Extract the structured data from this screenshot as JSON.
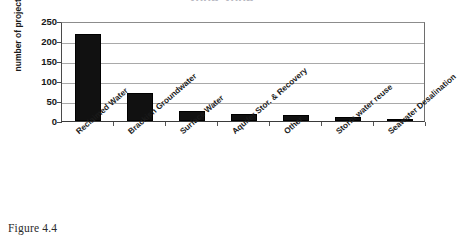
{
  "figure": {
    "caption": "Figure 4.4",
    "title_partial": "2005 2006"
  },
  "chart_data": {
    "type": "bar",
    "title": "",
    "xlabel": "",
    "ylabel": "number of projects",
    "ylim": [
      0,
      250
    ],
    "yticks": [
      0,
      50,
      100,
      150,
      200,
      250
    ],
    "grid": true,
    "legend": false,
    "orientation": "vertical",
    "bar_color": "#111111",
    "categories": [
      "Reclaimed Water",
      "Brackish Groundwater",
      "Surface Water",
      "Aquifer Stor. & Recovery",
      "Other",
      "Storm water reuse",
      "Seawater Desalination"
    ],
    "values": [
      218,
      70,
      25,
      18,
      14,
      10,
      2
    ]
  }
}
